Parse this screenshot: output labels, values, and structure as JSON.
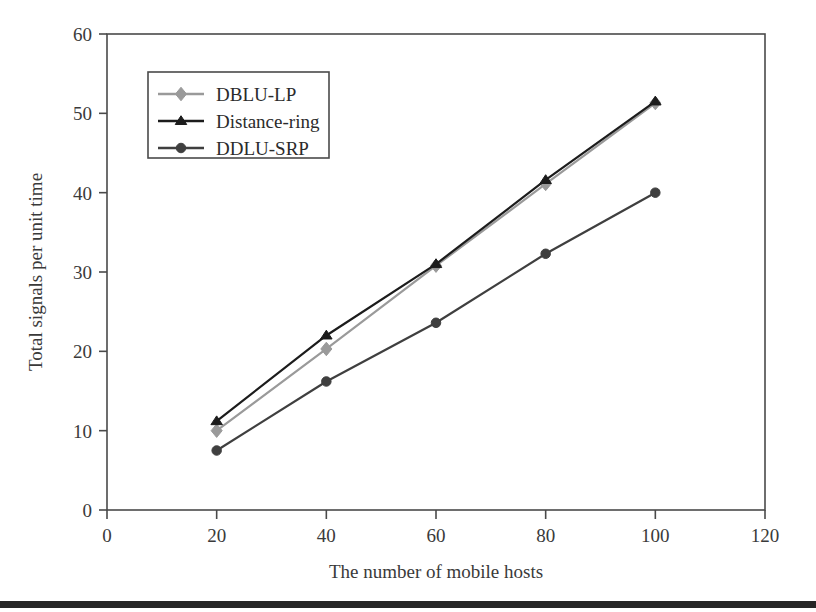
{
  "chart_data": {
    "type": "line",
    "title": "",
    "xlabel": "The number of mobile hosts",
    "ylabel": "Total signals per unit time",
    "xlim": [
      0,
      120
    ],
    "ylim": [
      0,
      60
    ],
    "xticks": [
      0,
      20,
      40,
      60,
      80,
      100,
      120
    ],
    "yticks": [
      0,
      10,
      20,
      30,
      40,
      50,
      60
    ],
    "xtick_labels": [
      "0",
      "20",
      "40",
      "60",
      "80",
      "100",
      "120"
    ],
    "ytick_labels": [
      "0",
      "10",
      "20",
      "30",
      "40",
      "50",
      "60"
    ],
    "grid": false,
    "legend_position": "upper left inside",
    "x": [
      20,
      40,
      60,
      80,
      100
    ],
    "series": [
      {
        "name": "DBLU-LP",
        "values": [
          10.0,
          20.3,
          30.8,
          41.1,
          51.3
        ],
        "color": "#9a9a9a",
        "marker": "diamond"
      },
      {
        "name": "Distance-ring",
        "values": [
          11.2,
          22.0,
          31.0,
          41.6,
          51.5
        ],
        "color": "#1c1c1c",
        "marker": "triangle"
      },
      {
        "name": "DDLU-SRP",
        "values": [
          7.5,
          16.2,
          23.6,
          32.3,
          40.0
        ],
        "color": "#3f3f3f",
        "marker": "circle"
      }
    ]
  },
  "legend": {
    "items": [
      {
        "label": "DBLU-LP"
      },
      {
        "label": "Distance-ring"
      },
      {
        "label": "DDLU-SRP"
      }
    ]
  },
  "axes": {
    "x_title": "The number of mobile hosts",
    "y_title": "Total signals per unit time",
    "x_ticks": [
      "0",
      "20",
      "40",
      "60",
      "80",
      "100",
      "120"
    ],
    "y_ticks": [
      "0",
      "10",
      "20",
      "30",
      "40",
      "50",
      "60"
    ]
  },
  "colors": {
    "frame": "#4a4a4a",
    "series_1": "#9a9a9a",
    "series_2": "#1c1c1c",
    "series_3": "#3f3f3f",
    "bottom_rule": "#262626"
  }
}
